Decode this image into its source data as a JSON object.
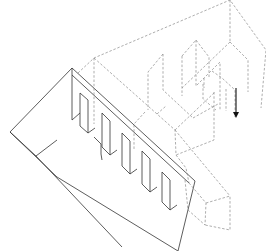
{
  "figure": {
    "type": "axonometric-exploded-drawing",
    "width": 266,
    "height": 251,
    "colors": {
      "background": "#ffffff",
      "solid_line": "#333333",
      "dashed_line": "#8a8a8a",
      "arrow": "#111111"
    }
  },
  "solid_paths": [
    "M72,68 L10,132 L57,177 L178,251",
    "M72,68 L195,181 L178,251",
    "M10,132 L36,156 L57,140",
    "M36,156 L122,247",
    "M72,68 L72,120 L80,113",
    "M72,75 L189,183",
    "M80,93 L88,100 L88,133 L80,126 Z",
    "M94,137 L101,144 L101,154 L102,160",
    "M102,113 L110,121 L110,155 L102,147 Z",
    "M122,133 L130,141 L130,174 L122,166 Z",
    "M142,151 L150,159 L150,192 L142,184 Z",
    "M162,172 L170,180 L170,210 L162,202 Z",
    "M88,133 L95,128",
    "M110,155 L117,150",
    "M130,174 L137,169",
    "M150,192 L157,187",
    "M170,210 L177,205"
  ],
  "dashed_paths": [
    "M78,73 L94,58 L230,0 L266,50 L261,108",
    "M94,58 L94,124",
    "M94,58 L175,130 L176,155",
    "M175,130 L215,92",
    "M214,92 L214,140 L176,155",
    "M182,56 L182,96",
    "M182,56 L196,40 L202,48 L209,57 L209,78",
    "M196,40 L196,86 L220,62 L220,110",
    "M163,54 L163,90 L193,118",
    "M163,54 L148,72 L148,110",
    "M212,71 L222,78 L235,90 L235,117",
    "M203,84 L203,99 L216,110",
    "M226,89 L226,111",
    "M230,0 L230,42",
    "M230,42 L248,60 L248,92",
    "M230,42 L182,88",
    "M145,112 L134,124 L134,150",
    "M193,118 L218,104",
    "M157,114 L166,106",
    "M176,155 L186,168 L189,183",
    "M189,183 L206,203 L205,225",
    "M206,203 L230,196 L230,230 L205,225",
    "M175,130 L230,196",
    "M185,180 L188,210 L205,225",
    "M204,78 L204,88"
  ],
  "arrow": {
    "x1": 236,
    "y1": 88,
    "x2": 236,
    "y2": 117,
    "direction": "down"
  }
}
